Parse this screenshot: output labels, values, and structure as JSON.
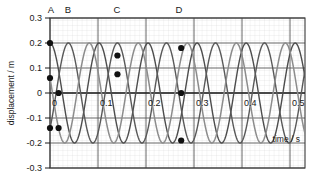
{
  "chart_data": {
    "type": "line",
    "title": "",
    "xlabel": "time / s",
    "ylabel": "displacement / m",
    "xlim": [
      0,
      0.52
    ],
    "ylim": [
      -0.3,
      0.3
    ],
    "xticks": [
      0,
      0.1,
      0.2,
      0.3,
      0.4,
      0.5
    ],
    "xtick_labels": [
      "0",
      "0.1",
      "0.2",
      "0.3",
      "0.4",
      "0.5"
    ],
    "yticks": [
      0.3,
      0.2,
      0.1,
      0,
      -0.1,
      -0.2,
      -0.3
    ],
    "ytick_labels": [
      "0.3",
      "0.2",
      "0.1",
      "0",
      "-0.1",
      "-0.2",
      "-0.3"
    ],
    "grid": true,
    "grid_minor": true,
    "amplitude": 0.2,
    "period": 0.1,
    "series": [
      {
        "name": "wave-1",
        "color": "#4d4d4d",
        "phase_deg": 0,
        "description": "cosine, starts at +0.2 m"
      },
      {
        "name": "wave-2",
        "color": "#8c8c8c",
        "phase_deg": 72,
        "description": "starts at +0.06 m rising"
      },
      {
        "name": "wave-3",
        "color": "#595959",
        "phase_deg": 225,
        "description": "starts at -0.14 m"
      }
    ],
    "markers": [
      {
        "label": "A",
        "t": 0.0,
        "d": 0.2
      },
      {
        "label": "A",
        "t": 0.0,
        "d": 0.06
      },
      {
        "label": "A",
        "t": 0.0,
        "d": -0.14
      },
      {
        "label": "B",
        "t": 0.0175,
        "d": 0.0
      },
      {
        "label": "B",
        "t": 0.0175,
        "d": -0.14
      },
      {
        "label": "C",
        "t": 0.1375,
        "d": 0.15
      },
      {
        "label": "C",
        "t": 0.1375,
        "d": 0.075
      },
      {
        "label": "D",
        "t": 0.2675,
        "d": 0.18
      },
      {
        "label": "D",
        "t": 0.2675,
        "d": 0.0
      },
      {
        "label": "D",
        "t": 0.2675,
        "d": -0.19
      }
    ],
    "annotations": [
      {
        "label": "A",
        "t": 0.0
      },
      {
        "label": "B",
        "t": 0.0175
      },
      {
        "label": "C",
        "t": 0.1375
      },
      {
        "label": "D",
        "t": 0.2675
      }
    ]
  },
  "axes": {
    "y_axis_label": "displacement / m",
    "x_axis_label": "time / s",
    "y_tick_labels": [
      "0.3",
      "0.2",
      "0.1",
      "0",
      "-0.1",
      "-0.2",
      "-0.3"
    ],
    "x_tick_labels": [
      "0",
      "0.1",
      "0.2",
      "0.3",
      "0.4",
      "0.5"
    ]
  },
  "markers_top": [
    "A",
    "B",
    "C",
    "D"
  ]
}
